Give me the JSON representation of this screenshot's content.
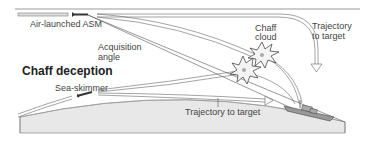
{
  "diagram": {
    "title": "Chaff deception",
    "labels": {
      "air_launched": "Air-launched ASM",
      "acquisition_1": "Acquisition",
      "acquisition_2": "angle",
      "chaff_1": "Chaff",
      "chaff_2": "cloud",
      "trajectory_top_1": "Trajectory",
      "trajectory_top_2": "to target",
      "sea_skimmer": "Sea-skimmer",
      "trajectory_bottom": "Trajectory to target"
    },
    "colors": {
      "line": "#555555",
      "sea": "#e6e6e6",
      "cloud": "#f2f2f2",
      "ship": "#888888"
    }
  }
}
